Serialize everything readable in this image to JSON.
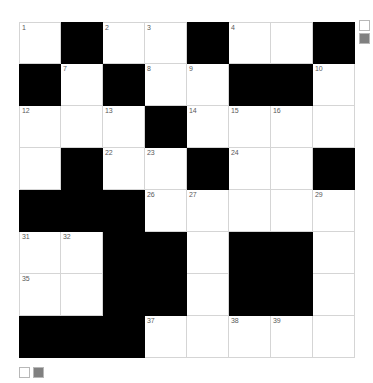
{
  "puzzle": {
    "title": "Crossword Grid",
    "rows": 8,
    "columns": 8,
    "cell_size_px": 42,
    "colors": {
      "block": "#000000",
      "open": "#ffffff",
      "grid_line": "#d5d5d5",
      "number_text": "#5a5a5a",
      "swatch_white": "#ffffff",
      "swatch_gray": "#808080",
      "swatch_border": "#b8b8b8"
    },
    "grid": [
      [
        {
          "type": "open",
          "number": "1",
          "letter": ""
        },
        {
          "type": "block",
          "number": "",
          "letter": ""
        },
        {
          "type": "open",
          "number": "2",
          "letter": ""
        },
        {
          "type": "open",
          "number": "3",
          "letter": ""
        },
        {
          "type": "block",
          "number": "",
          "letter": ""
        },
        {
          "type": "open",
          "number": "4",
          "letter": ""
        },
        {
          "type": "open",
          "number": "",
          "letter": ""
        },
        {
          "type": "block",
          "number": "",
          "letter": ""
        }
      ],
      [
        {
          "type": "block",
          "number": "",
          "letter": ""
        },
        {
          "type": "open",
          "number": "7",
          "letter": ""
        },
        {
          "type": "block",
          "number": "",
          "letter": ""
        },
        {
          "type": "open",
          "number": "8",
          "letter": ""
        },
        {
          "type": "open",
          "number": "9",
          "letter": ""
        },
        {
          "type": "block",
          "number": "",
          "letter": ""
        },
        {
          "type": "block",
          "number": "",
          "letter": ""
        },
        {
          "type": "open",
          "number": "10",
          "letter": ""
        }
      ],
      [
        {
          "type": "open",
          "number": "12",
          "letter": ""
        },
        {
          "type": "open",
          "number": "",
          "letter": ""
        },
        {
          "type": "open",
          "number": "13",
          "letter": ""
        },
        {
          "type": "block",
          "number": "",
          "letter": ""
        },
        {
          "type": "open",
          "number": "14",
          "letter": ""
        },
        {
          "type": "open",
          "number": "15",
          "letter": ""
        },
        {
          "type": "open",
          "number": "16",
          "letter": ""
        },
        {
          "type": "open",
          "number": "",
          "letter": ""
        }
      ],
      [
        {
          "type": "open",
          "number": "",
          "letter": ""
        },
        {
          "type": "block",
          "number": "",
          "letter": ""
        },
        {
          "type": "open",
          "number": "22",
          "letter": ""
        },
        {
          "type": "open",
          "number": "23",
          "letter": ""
        },
        {
          "type": "block",
          "number": "",
          "letter": ""
        },
        {
          "type": "open",
          "number": "24",
          "letter": ""
        },
        {
          "type": "open",
          "number": "",
          "letter": ""
        },
        {
          "type": "block",
          "number": "",
          "letter": ""
        }
      ],
      [
        {
          "type": "block",
          "number": "",
          "letter": ""
        },
        {
          "type": "block",
          "number": "",
          "letter": ""
        },
        {
          "type": "block",
          "number": "",
          "letter": ""
        },
        {
          "type": "open",
          "number": "26",
          "letter": ""
        },
        {
          "type": "open",
          "number": "27",
          "letter": ""
        },
        {
          "type": "open",
          "number": "",
          "letter": ""
        },
        {
          "type": "open",
          "number": "",
          "letter": ""
        },
        {
          "type": "open",
          "number": "29",
          "letter": ""
        }
      ],
      [
        {
          "type": "open",
          "number": "31",
          "letter": ""
        },
        {
          "type": "open",
          "number": "32",
          "letter": ""
        },
        {
          "type": "block",
          "number": "",
          "letter": ""
        },
        {
          "type": "block",
          "number": "",
          "letter": ""
        },
        {
          "type": "open",
          "number": "",
          "letter": ""
        },
        {
          "type": "block",
          "number": "",
          "letter": ""
        },
        {
          "type": "block",
          "number": "",
          "letter": ""
        },
        {
          "type": "open",
          "number": "",
          "letter": ""
        }
      ],
      [
        {
          "type": "open",
          "number": "35",
          "letter": ""
        },
        {
          "type": "open",
          "number": "",
          "letter": ""
        },
        {
          "type": "block",
          "number": "",
          "letter": ""
        },
        {
          "type": "block",
          "number": "",
          "letter": ""
        },
        {
          "type": "open",
          "number": "",
          "letter": ""
        },
        {
          "type": "block",
          "number": "",
          "letter": ""
        },
        {
          "type": "block",
          "number": "",
          "letter": ""
        },
        {
          "type": "open",
          "number": "",
          "letter": ""
        }
      ],
      [
        {
          "type": "block",
          "number": "",
          "letter": ""
        },
        {
          "type": "block",
          "number": "",
          "letter": ""
        },
        {
          "type": "block",
          "number": "",
          "letter": ""
        },
        {
          "type": "open",
          "number": "37",
          "letter": ""
        },
        {
          "type": "open",
          "number": "",
          "letter": ""
        },
        {
          "type": "open",
          "number": "38",
          "letter": ""
        },
        {
          "type": "open",
          "number": "39",
          "letter": ""
        },
        {
          "type": "open",
          "number": "",
          "letter": ""
        }
      ]
    ]
  },
  "legend_top_right": {
    "swatches": [
      {
        "name": "swatch-white",
        "color": "#ffffff"
      },
      {
        "name": "swatch-gray",
        "color": "#808080"
      }
    ]
  },
  "legend_bottom_left": {
    "swatches": [
      {
        "name": "swatch-white",
        "color": "#ffffff"
      },
      {
        "name": "swatch-gray",
        "color": "#808080"
      }
    ]
  }
}
